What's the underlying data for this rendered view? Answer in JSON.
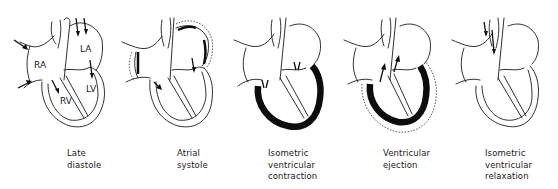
{
  "figure": {
    "panels": [
      {
        "id": "late-diastole",
        "caption_lines": [
          "Late",
          "diastole"
        ],
        "chamber_labels": {
          "ra": "RA",
          "la": "LA",
          "rv": "RV",
          "lv": "LV"
        }
      },
      {
        "id": "atrial-systole",
        "caption_lines": [
          "Atrial",
          "systole"
        ]
      },
      {
        "id": "isometric-ventricular-contraction",
        "caption_lines": [
          "Isometric",
          "ventricular",
          "contraction"
        ]
      },
      {
        "id": "ventricular-ejection",
        "caption_lines": [
          "Ventricular",
          "ejection"
        ]
      },
      {
        "id": "isometric-ventricular-relaxation",
        "caption_lines": [
          "Isometric",
          "ventricular",
          "relaxation"
        ]
      }
    ],
    "colors": {
      "line": "#1a1a1a",
      "contracting_muscle": "#0d0d0d",
      "background": "#ffffff"
    }
  }
}
